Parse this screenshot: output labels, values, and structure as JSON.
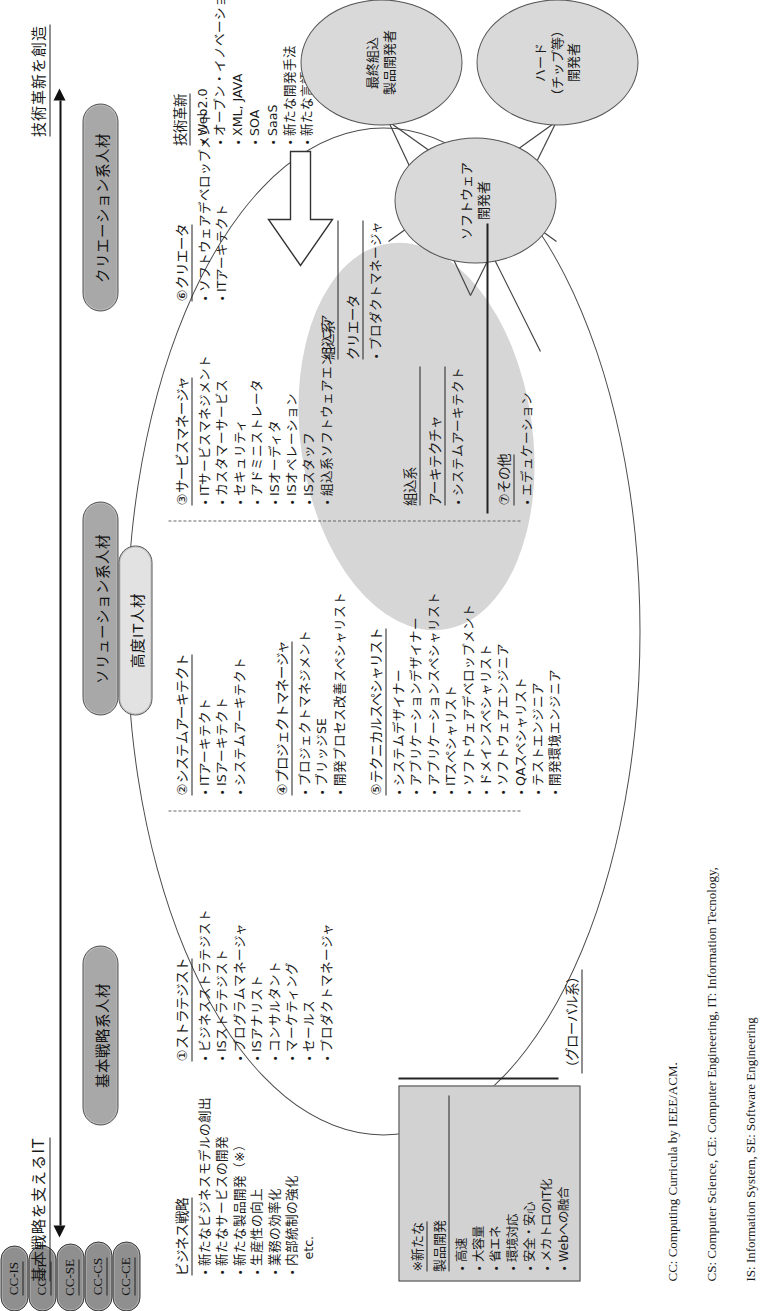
{
  "axis": {
    "left_label": "基本戦略を支えるIT",
    "right_label": "技術革新を創造"
  },
  "categories": [
    {
      "id": "kihon",
      "label": "基本戦略系人材"
    },
    {
      "id": "solution",
      "label": "ソリューション系人材"
    },
    {
      "id": "creation",
      "label": "クリエーション系人材"
    },
    {
      "id": "kodo",
      "label": "高度IT人材"
    }
  ],
  "business_strategy": {
    "title": "ビジネス戦略",
    "items": [
      "新たなビジネスモデルの創出",
      "新たなサービスの開発",
      "新たな製品開発（※）",
      "生産性の向上",
      "業務の効率化",
      "内部統制の強化"
    ],
    "etc": "etc."
  },
  "note_box": {
    "title": "※新たな",
    "subtitle": "製品開発",
    "items": [
      "高速",
      "大容量",
      "省エネ",
      "環境対応",
      "安全・安心",
      "メカトロのIT化",
      "Webへの融合"
    ]
  },
  "global_label": "（グローバル系）",
  "innovation": {
    "title": "技術革新",
    "items": [
      "Web2.0",
      "オープン・イノベーション",
      "XML, JAVA",
      "SOA",
      "SaaS",
      "新たな開発手法",
      "新たな言語"
    ],
    "etc": "etc."
  },
  "groups": [
    {
      "num": "①",
      "title": "ストラテジスト",
      "tag": "CC-IS",
      "items": [
        "ビジネスストラテジスト",
        "ISストラテジスト",
        "プログラムマネージャ",
        "ISアナリスト",
        "コンサルタント",
        "マーケティング",
        "セールス",
        "プロダクトマネージャ"
      ]
    },
    {
      "num": "②",
      "title": "システムアーキテクト",
      "tag": "CC-SE",
      "items": [
        "ITアーキテクト",
        "ISアーキテクト",
        "システムアーキテクト"
      ]
    },
    {
      "num": "③",
      "title": "サービスマネージャ",
      "tag": "CC-CS",
      "items": [
        "ITサービスマネジメント",
        "カスタマーサービス",
        "セキュリティ",
        "アドミニストレータ",
        "ISオーディタ",
        "ISオペレーション",
        "ISスタッフ",
        "組込系ソフトウェアエンジニア"
      ]
    },
    {
      "num": "④",
      "title": "プロジェクトマネージャ",
      "tag": "",
      "items": [
        "プロジェクトマネジメント",
        "ブリッジSE",
        "開発プロセス改善スペシャリスト"
      ]
    },
    {
      "num": "⑤",
      "title": "テクニカルスペシャリスト",
      "tag": "",
      "items": [
        "システムデザイナー",
        "アプリケーションデザイナー",
        "アプリケーションスペシャリスト",
        "ITスペシャリスト",
        "ソフトウェアデベロップメント",
        "ドメインスペシャリスト",
        "ソフトウェアエンジニア",
        "QAスペシャリスト",
        "テストエンジニア",
        "開発環境エンジニア"
      ]
    },
    {
      "num": "⑥",
      "title": "クリエータ",
      "tag": "",
      "items": [
        "ソフトウェアデベロップメント",
        "ITアーキテクト"
      ]
    },
    {
      "num": "⑦",
      "title": "その他",
      "tag": "",
      "items": [
        "エデュケーション"
      ]
    }
  ],
  "embedded": {
    "creator": {
      "title": "組込系",
      "subtitle": "クリエータ",
      "items": [
        "プロダクトマネージャ"
      ],
      "tag": "CC-CE"
    },
    "architect": {
      "title": "組込系",
      "subtitle": "アーキテクチャ",
      "items": [
        "システムアーキテクト"
      ],
      "tag": "CC-IT"
    }
  },
  "orbs": [
    {
      "id": "software",
      "text": "ソフトウェア\n開発者"
    },
    {
      "id": "hardware",
      "text": "ハード\n（チップ等）\n開発者"
    },
    {
      "id": "final",
      "text": "最終組込\n製品開発者"
    }
  ],
  "legend": {
    "line1": "CC: Computing Curricula by IEEE/ACM.",
    "line2": "CS: Computer Science, CE: Computer Engineering, IT: Information Tecnology,",
    "line3": "IS: Information System, SE: Software Engineering"
  }
}
